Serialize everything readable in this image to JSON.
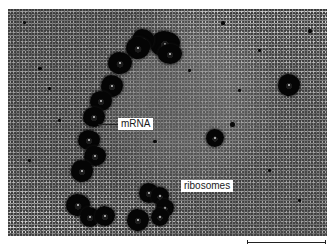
{
  "figure": {
    "type": "electron-micrograph",
    "labels": {
      "mrna": "mRNA",
      "ribosomes": "ribosomes"
    },
    "scale_bar": {
      "label": ""
    },
    "colors": {
      "background": "#ffffff",
      "micrograph_mid_gray": "#8c8c8c",
      "ribosome": "#050505",
      "label_bg": "#ffffff",
      "label_text": "#1a1a1a"
    }
  }
}
